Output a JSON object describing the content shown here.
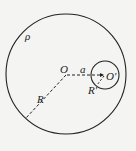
{
  "diagram": {
    "labels": {
      "density": "ρ",
      "center": "O",
      "offset": "a",
      "cavity_center": "O′",
      "big_radius": "R",
      "small_radius": "R′"
    },
    "colors": {
      "stroke": "#222222",
      "background": "#f4f4f2"
    }
  }
}
